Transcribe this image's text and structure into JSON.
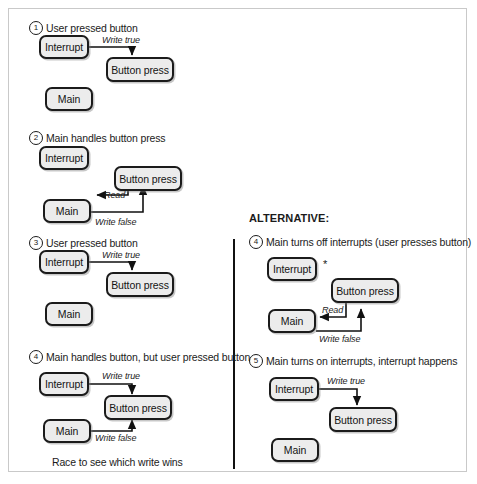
{
  "diagram": {
    "divider": {
      "orientation": "vertical"
    },
    "alternative_heading": "ALTERNATIVE:",
    "caption_left": "Race to see which write wins",
    "asterisk": "*",
    "node_labels": {
      "interrupt": "Interrupt",
      "button_press": "Button press",
      "main": "Main"
    },
    "edge_labels": {
      "write_true": "Write true",
      "write_false": "Write false",
      "read": "Read"
    },
    "panels": [
      {
        "id": "left-1",
        "number": "1",
        "title": "User pressed button",
        "nodes": [
          "Interrupt",
          "Button press",
          "Main"
        ],
        "edges": [
          {
            "label": "Write true",
            "from": "Interrupt",
            "to": "Button press"
          }
        ]
      },
      {
        "id": "left-2",
        "number": "2",
        "title": "Main handles button press",
        "nodes": [
          "Interrupt",
          "Button press",
          "Main"
        ],
        "edges": [
          {
            "label": "Read",
            "from": "Button press",
            "to": "Main"
          },
          {
            "label": "Write false",
            "from": "Main",
            "to": "Button press"
          }
        ]
      },
      {
        "id": "left-3",
        "number": "3",
        "title": "User pressed button",
        "nodes": [
          "Interrupt",
          "Button press",
          "Main"
        ],
        "edges": [
          {
            "label": "Write true",
            "from": "Interrupt",
            "to": "Button press"
          }
        ]
      },
      {
        "id": "left-4",
        "number": "4",
        "title": "Main handles button, but user pressed button",
        "nodes": [
          "Interrupt",
          "Button press",
          "Main"
        ],
        "edges": [
          {
            "label": "Write true",
            "from": "Interrupt",
            "to": "Button press"
          },
          {
            "label": "Write false",
            "from": "Main",
            "to": "Button press"
          }
        ],
        "caption": "Race to see which write wins"
      },
      {
        "id": "right-4",
        "number": "4",
        "title": "Main turns off interrupts (user presses button)",
        "nodes": [
          "Interrupt",
          "Button press",
          "Main"
        ],
        "edges": [
          {
            "label": "Read",
            "from": "Button press",
            "to": "Main"
          },
          {
            "label": "Write false",
            "from": "Main",
            "to": "Button press"
          }
        ]
      },
      {
        "id": "right-5",
        "number": "5",
        "title": "Main turns on interrupts,  interrupt happens",
        "nodes": [
          "Interrupt",
          "Button press",
          "Main"
        ],
        "edges": [
          {
            "label": "Write true",
            "from": "Interrupt",
            "to": "Button press"
          }
        ]
      }
    ]
  },
  "colors": {
    "node_fill": "#ececec",
    "node_stroke": "#1b1b1b",
    "page_border": "#c9c9c9",
    "text": "#1b1b1b"
  }
}
